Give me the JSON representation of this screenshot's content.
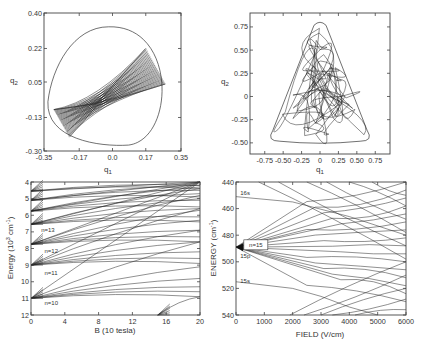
{
  "chart_data": [
    {
      "id": "panel-a",
      "type": "line",
      "title": "",
      "xlabel": "q1",
      "ylabel": "q2",
      "xlim": [
        -0.35,
        0.35
      ],
      "ylim": [
        -0.3,
        0.4
      ],
      "xticks": [
        -0.35,
        -0.17,
        0.0,
        0.17,
        0.35
      ],
      "xtick_labels": [
        "-0.35",
        "-0.17",
        "0.0",
        "0.17",
        "0.35"
      ],
      "yticks": [
        -0.3,
        -0.13,
        0.05,
        0.22,
        0.4
      ],
      "ytick_labels": [
        "-0.30",
        "-0.13",
        "0.05",
        "0.22",
        "0.40"
      ],
      "grid": false,
      "description": "Regular (quasi-periodic) trajectory filling a bow-tie shaped band inside a rounded-triangular equipotential boundary",
      "boundary": {
        "top": 0.33,
        "bottom": -0.27,
        "left": -0.33,
        "right": 0.3
      },
      "band": {
        "center": [
          -0.08,
          -0.06
        ],
        "upper_end": [
          0.17,
          0.22
        ],
        "lower_end": [
          0.27,
          0.04
        ],
        "left_top": [
          -0.3,
          -0.09
        ],
        "left_bottom": [
          -0.22,
          -0.23
        ]
      }
    },
    {
      "id": "panel-b",
      "type": "line",
      "title": "",
      "xlabel": "q1",
      "ylabel": "q2",
      "xlim": [
        -0.95,
        0.95
      ],
      "ylim": [
        -0.62,
        0.9
      ],
      "xticks": [
        -0.75,
        -0.5,
        -0.25,
        0,
        0.25,
        0.5,
        0.75
      ],
      "xtick_labels": [
        "-0.75",
        "-0.50",
        "-0.25",
        "0",
        "0.25",
        "0.50",
        "0.75"
      ],
      "yticks": [
        -0.5,
        -0.25,
        0,
        0.25,
        0.5,
        0.75
      ],
      "ytick_labels": [
        "-0.50",
        "-0.25",
        "0",
        "0.25",
        "0.50",
        "0.75"
      ],
      "grid": false,
      "description": "Chaotic trajectory filling a triangular equipotential boundary",
      "boundary": {
        "apex": [
          0,
          0.8
        ],
        "left": [
          -0.68,
          -0.45
        ],
        "right": [
          0.68,
          -0.45
        ]
      }
    },
    {
      "id": "panel-c",
      "type": "line",
      "title": "",
      "xlabel": "B (10 tesla)",
      "ylabel": "Energy (10^2 cm^-1)",
      "xlim": [
        0,
        20
      ],
      "ylim": [
        12,
        4
      ],
      "xticks": [
        0,
        4,
        8,
        12,
        16,
        20
      ],
      "xtick_labels": [
        "0",
        "4",
        "8",
        "12",
        "16",
        "20"
      ],
      "yticks": [
        4,
        5,
        6,
        7,
        8,
        9,
        10,
        11,
        12
      ],
      "ytick_labels": [
        "4",
        "5",
        "6",
        "7",
        "8",
        "9",
        "10",
        "11",
        "12"
      ],
      "grid": false,
      "annotations": [
        {
          "text": "n=13",
          "x": 1.2,
          "y": 7.0
        },
        {
          "text": "n=12",
          "x": 1.6,
          "y": 8.3
        },
        {
          "text": "n=11",
          "x": 1.6,
          "y": 9.6
        },
        {
          "text": "n=10",
          "x": 1.6,
          "y": 11.4
        }
      ],
      "series": [
        {
          "name": "n=10 fan",
          "origin": [
            0,
            11.0
          ],
          "endpoints_y_at_20": [
            4.0,
            7.6,
            9.1,
            9.8,
            10.3,
            10.6,
            10.9
          ]
        },
        {
          "name": "n=11 fan",
          "origin": [
            0,
            9.0
          ],
          "endpoints_y_at_20": [
            4.0,
            5.6,
            6.9,
            7.6,
            8.2,
            8.6,
            8.9
          ]
        },
        {
          "name": "n=12 fan",
          "origin": [
            0,
            7.75
          ],
          "endpoints_y_at_20": [
            4.0,
            4.8,
            5.7,
            6.3,
            6.9,
            7.3,
            7.6
          ]
        },
        {
          "name": "n=13 fan",
          "origin": [
            0,
            6.55
          ],
          "endpoints_y_at_20": [
            4.0,
            4.4,
            5.0,
            5.6,
            6.1,
            6.4
          ]
        },
        {
          "name": "n=14 fan",
          "origin": [
            0,
            5.75
          ],
          "endpoints_y_at_20": [
            4.0,
            4.3,
            4.7,
            5.1,
            5.5
          ]
        },
        {
          "name": "n=15 fan",
          "origin": [
            0,
            5.1
          ],
          "endpoints_y_at_20": [
            4.0,
            4.2,
            4.5,
            4.9
          ]
        },
        {
          "name": "n=16 fan",
          "origin": [
            0,
            4.55
          ],
          "endpoints_y_at_20": [
            4.0,
            4.2,
            4.4
          ]
        },
        {
          "name": "low level",
          "origin": [
            15,
            12.0
          ],
          "endpoints_y_at_20": [
            10.9
          ]
        }
      ]
    },
    {
      "id": "panel-d",
      "type": "line",
      "title": "",
      "xlabel": "FIELD (V/cm)",
      "ylabel": "ENERGY (cm^-1)",
      "xlim": [
        0,
        6000
      ],
      "ylim": [
        540,
        440
      ],
      "xticks": [
        0,
        1000,
        2000,
        3000,
        4000,
        5000,
        6000
      ],
      "xtick_labels": [
        "0",
        "1000",
        "2000",
        "3000",
        "4000",
        "5000",
        "6000"
      ],
      "yticks": [
        440,
        460,
        480,
        500,
        520,
        540
      ],
      "ytick_labels": [
        "440",
        "460",
        "480",
        "500",
        "520",
        "540"
      ],
      "grid": false,
      "annotations": [
        {
          "text": "n=15",
          "x": 700,
          "y": 488,
          "boxed": true
        },
        {
          "text": "16s",
          "x": 150,
          "y": 450
        },
        {
          "text": "15p",
          "x": 150,
          "y": 497
        },
        {
          "text": "15s",
          "x": 150,
          "y": 516
        }
      ],
      "series": [
        {
          "name": "n=15 Stark fan",
          "origin": [
            0,
            489
          ],
          "endpoints_y_at_6000": [
            440,
            446,
            452,
            458,
            464,
            470,
            476,
            482,
            488,
            494,
            500,
            506,
            512,
            518,
            524,
            530
          ]
        },
        {
          "name": "16s",
          "points": [
            [
              0,
              451
            ],
            [
              2000,
              455
            ],
            [
              4000,
              466
            ],
            [
              6000,
              480
            ]
          ]
        },
        {
          "name": "15s",
          "points": [
            [
              0,
              515
            ],
            [
              2000,
              520
            ],
            [
              3000,
              526
            ],
            [
              4000,
              534
            ],
            [
              5000,
              540
            ]
          ]
        },
        {
          "name": "n=16 manifold (upper right)",
          "start_x": [
            800,
            1500,
            2500,
            3200,
            4000,
            4800
          ],
          "start_y": 440,
          "end_y_at_6000": [
            498,
            488,
            478,
            468,
            458,
            450
          ]
        },
        {
          "name": "n=14 manifold (lower)",
          "start_x": [
            1900,
            2400,
            3000,
            3400,
            4200
          ],
          "start_y": 540,
          "end_y_at_6000": [
            500,
            510,
            520,
            528,
            536
          ]
        }
      ]
    }
  ],
  "panels": {
    "a": {
      "xlabel": "q",
      "xlabel_sub": "1",
      "ylabel": "q",
      "ylabel_sub": "2"
    },
    "b": {
      "xlabel": "q",
      "xlabel_sub": "1",
      "ylabel": "q",
      "ylabel_sub": "2"
    },
    "c": {
      "xlabel": "B (10 tesla)",
      "ylabel": "Energy (10",
      "ylabel_exp": "3",
      "ylabel_unit": " cm",
      "ylabel_unit_exp": "-1",
      "ylabel_close": ")"
    },
    "d": {
      "xlabel": "FIELD  (V/cm)",
      "ylabel": "ENERGY  (cm",
      "ylabel_exp": "-1",
      "ylabel_close": ")"
    }
  }
}
